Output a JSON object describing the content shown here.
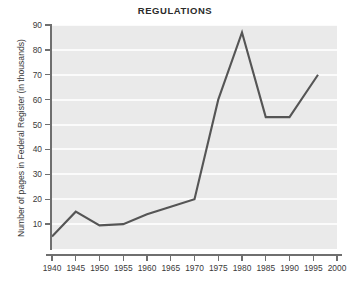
{
  "chart_data": {
    "type": "line",
    "title": "REGULATIONS",
    "xlabel": "",
    "ylabel": "Number of pages in Federal Register (in thousands)",
    "x": [
      1940,
      1945,
      1950,
      1955,
      1960,
      1965,
      1970,
      1975,
      1980,
      1985,
      1990,
      1996
    ],
    "values": [
      5,
      15,
      9.5,
      10,
      14,
      17,
      20,
      60,
      87,
      53,
      53,
      70
    ],
    "series": [
      {
        "name": "Number of pages in Federal Register (in thousands)",
        "values": [
          5,
          15,
          9.5,
          10,
          14,
          17,
          20,
          60,
          87,
          53,
          53,
          70
        ]
      }
    ],
    "xlim": [
      1940,
      2000
    ],
    "ylim": [
      0,
      90
    ],
    "xticks": [
      1940,
      1945,
      1950,
      1955,
      1960,
      1965,
      1970,
      1975,
      1980,
      1985,
      1990,
      1995,
      2000
    ],
    "xtick_labels": [
      "1940",
      "1945",
      "1950",
      "1955",
      "1960",
      "1965",
      "1970",
      "1975",
      "1980",
      "1985",
      "1990",
      "1995",
      "2000"
    ],
    "yticks": [
      10,
      20,
      30,
      40,
      50,
      60,
      70,
      80,
      90
    ],
    "ytick_labels": [
      "10",
      "20",
      "30",
      "40",
      "50",
      "60",
      "70",
      "80",
      "90"
    ],
    "grid": true,
    "grid_orientation": "horizontal",
    "legend": false,
    "legend_position": "none",
    "line_color": "#555555",
    "plot_background": "#eaeaea",
    "gridline_color": "#fbfbfb",
    "axis_color": "#6f6f6f",
    "page_background": "#ffffff"
  }
}
